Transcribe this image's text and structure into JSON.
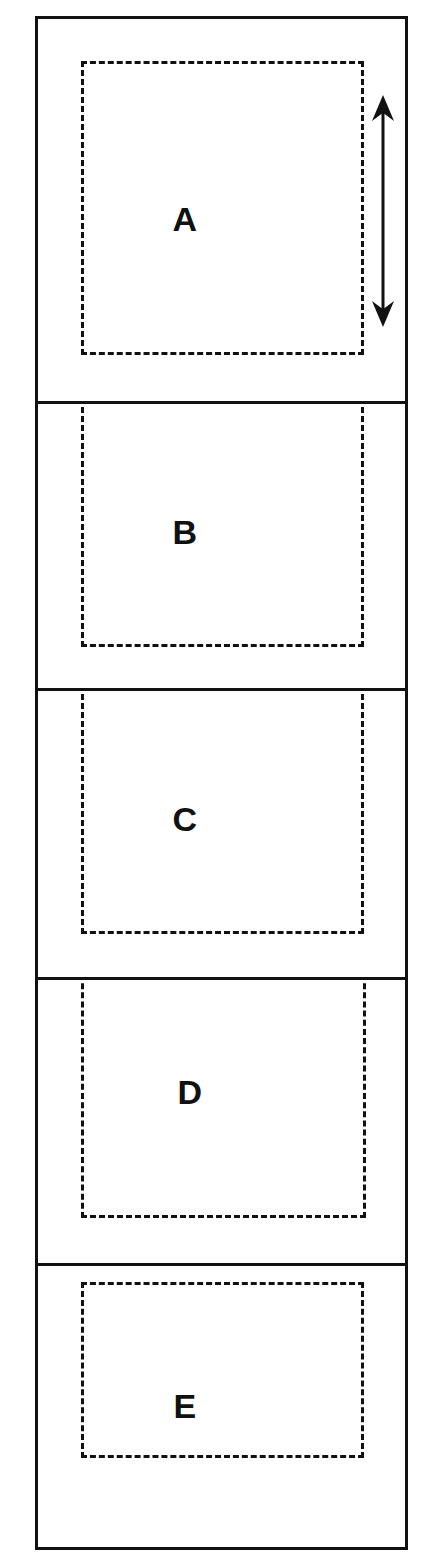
{
  "figure": {
    "type": "stacked-panel-schematic",
    "width": 437,
    "height": 1566,
    "background_color": "#ffffff",
    "line_color": "#111111",
    "frame": {
      "x": 35,
      "y": 16,
      "width": 373,
      "height": 1534,
      "stroke": 3
    }
  },
  "panels": [
    {
      "label": "A",
      "top": 0,
      "height": 382,
      "label_x": 147,
      "label_y": 200,
      "dashed": {
        "left": 43,
        "top": 42,
        "width": 283,
        "height": 294,
        "clip_top": false
      }
    },
    {
      "label": "B",
      "top": 382,
      "height": 287,
      "label_x": 147,
      "label_y": 128,
      "dashed": {
        "left": 43,
        "top": -6,
        "width": 283,
        "height": 249,
        "clip_top": true
      }
    },
    {
      "label": "C",
      "top": 669,
      "height": 289,
      "label_x": 147,
      "label_y": 128,
      "dashed": {
        "left": 43,
        "top": -6,
        "width": 283,
        "height": 249,
        "clip_top": true
      }
    },
    {
      "label": "D",
      "top": 958,
      "height": 286,
      "label_x": 152,
      "label_y": 112,
      "dashed": {
        "left": 43,
        "top": -6,
        "width": 285,
        "height": 244,
        "clip_top": true
      }
    },
    {
      "label": "E",
      "top": 1244,
      "height": 290,
      "label_x": 147,
      "label_y": 140,
      "dashed": {
        "left": 43,
        "top": 16,
        "width": 283,
        "height": 176,
        "clip_top": false
      }
    }
  ],
  "annotations": {
    "height_arrow": {
      "icon": "double-headed-vertical-arrow",
      "panel": "A",
      "x": 383,
      "y_top": 95,
      "y_bottom": 327,
      "stroke": 3,
      "color": "#111111"
    }
  }
}
